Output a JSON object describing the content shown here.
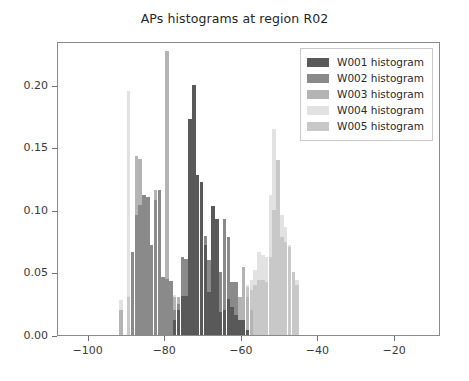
{
  "chart_data": {
    "type": "bar",
    "title": "APs histograms at region R02",
    "xlabel": "",
    "ylabel": "",
    "xlim": [
      -108,
      -8
    ],
    "ylim": [
      0,
      0.235
    ],
    "grid": false,
    "legend_position": "upper right",
    "xticks": [
      -100,
      -80,
      -60,
      -40,
      -20
    ],
    "xticklabels": [
      "−100",
      "−80",
      "−60",
      "−40",
      "−20"
    ],
    "yticks": [
      0.0,
      0.05,
      0.1,
      0.15,
      0.2
    ],
    "yticklabels": [
      "0.00",
      "0.05",
      "0.10",
      "0.15",
      "0.20"
    ],
    "bin_width": 1.0,
    "series": [
      {
        "name": "W001 histogram",
        "color": "#595959",
        "x": [
          -78,
          -77,
          -76,
          -75,
          -74,
          -73,
          -72,
          -71,
          -70,
          -69,
          -68,
          -67,
          -66,
          -65,
          -64,
          -63,
          -62,
          -61,
          -60,
          -59
        ],
        "values": [
          0.012,
          0.02,
          0.031,
          0.031,
          0.173,
          0.2,
          0.128,
          0.122,
          0.072,
          0.034,
          0.103,
          0.093,
          0.018,
          0.02,
          0.029,
          0.022,
          0.016,
          0.012,
          0.012,
          0.004
        ]
      },
      {
        "name": "W002 histogram",
        "color": "#8a8a8a",
        "x": [
          -89,
          -88,
          -87,
          -86,
          -85,
          -84,
          -83,
          -82,
          -81,
          -80,
          -79,
          -78,
          -77,
          -76,
          -75,
          -74,
          -73,
          -72,
          -71,
          -70,
          -69,
          -68,
          -67,
          -66,
          -65,
          -64,
          -63,
          -62,
          -61,
          -60
        ],
        "values": [
          0.066,
          0.096,
          0.104,
          0.112,
          0.11,
          0.072,
          0.108,
          0.116,
          0.046,
          0.045,
          0.043,
          0.02,
          0.025,
          0.062,
          0.061,
          0.057,
          0.048,
          0.06,
          0.08,
          0.079,
          0.06,
          0.078,
          0.071,
          0.05,
          0.093,
          0.078,
          0.042,
          0.042,
          0.01,
          0.01
        ]
      },
      {
        "name": "W003 histogram",
        "color": "#b4b4b4",
        "x": [
          -92,
          -89,
          -88,
          -87,
          -86,
          -85,
          -84,
          -83,
          -82,
          -81,
          -80,
          -79,
          -78,
          -77,
          -76,
          -75,
          -74,
          -73,
          -72,
          -71,
          -70,
          -69,
          -68,
          -67,
          -66,
          -65,
          -64,
          -63,
          -62,
          -61,
          -60,
          -59,
          -58
        ],
        "values": [
          0.02,
          0.06,
          0.143,
          0.141,
          0.089,
          0.07,
          0.063,
          0.116,
          0.07,
          0.04,
          0.227,
          0.042,
          0.03,
          0.03,
          0.04,
          0.043,
          0.06,
          0.041,
          0.06,
          0.052,
          0.045,
          0.048,
          0.04,
          0.034,
          0.033,
          0.03,
          0.026,
          0.033,
          0.03,
          0.03,
          0.054,
          0.03,
          0.02
        ]
      },
      {
        "name": "W004 histogram",
        "color": "#e2e2e2",
        "x": [
          -92,
          -90,
          -89,
          -88,
          -87,
          -86,
          -85,
          -84,
          -83,
          -82,
          -81,
          -80,
          -79,
          -78,
          -77,
          -76,
          -75,
          -74,
          -73,
          -72,
          -71,
          -70,
          -69,
          -68,
          -67,
          -66,
          -65,
          -64,
          -63,
          -62,
          -61,
          -60,
          -59,
          -58,
          -57,
          -56,
          -55,
          -54,
          -53,
          -52,
          -51,
          -50,
          -49,
          -48,
          -47,
          -46
        ],
        "values": [
          0.028,
          0.195,
          0.05,
          0.046,
          0.042,
          0.042,
          0.04,
          0.04,
          0.04,
          0.04,
          0.036,
          0.034,
          0.034,
          0.032,
          0.03,
          0.03,
          0.03,
          0.03,
          0.028,
          0.028,
          0.027,
          0.027,
          0.026,
          0.026,
          0.026,
          0.026,
          0.026,
          0.026,
          0.026,
          0.026,
          0.03,
          0.054,
          0.04,
          0.044,
          0.052,
          0.066,
          0.064,
          0.062,
          0.112,
          0.165,
          0.1,
          0.096,
          0.086,
          0.072,
          0.044,
          0.044
        ]
      },
      {
        "name": "W005 histogram",
        "color": "#c8c8c8",
        "x": [
          -90,
          -89,
          -88,
          -87,
          -86,
          -85,
          -84,
          -83,
          -82,
          -81,
          -80,
          -79,
          -78,
          -77,
          -76,
          -75,
          -74,
          -73,
          -72,
          -71,
          -70,
          -69,
          -68,
          -67,
          -66,
          -65,
          -64,
          -63,
          -62,
          -61,
          -60,
          -59,
          -58,
          -57,
          -56,
          -55,
          -54,
          -53,
          -52,
          -51,
          -50,
          -49,
          -48,
          -47,
          -46
        ],
        "values": [
          0.03,
          0.04,
          0.048,
          0.044,
          0.04,
          0.04,
          0.038,
          0.04,
          0.07,
          0.04,
          0.032,
          0.03,
          0.028,
          0.03,
          0.03,
          0.03,
          0.03,
          0.03,
          0.028,
          0.028,
          0.028,
          0.028,
          0.028,
          0.028,
          0.028,
          0.028,
          0.028,
          0.028,
          0.026,
          0.026,
          0.03,
          0.038,
          0.036,
          0.04,
          0.044,
          0.044,
          0.042,
          0.062,
          0.1,
          0.14,
          0.078,
          0.074,
          0.07,
          0.05,
          0.04
        ]
      }
    ]
  },
  "legend": {
    "items": [
      {
        "label": "W001 histogram",
        "color": "#595959"
      },
      {
        "label": "W002 histogram",
        "color": "#8a8a8a"
      },
      {
        "label": "W003 histogram",
        "color": "#b4b4b4"
      },
      {
        "label": "W004 histogram",
        "color": "#e2e2e2"
      },
      {
        "label": "W005 histogram",
        "color": "#c8c8c8"
      }
    ]
  }
}
